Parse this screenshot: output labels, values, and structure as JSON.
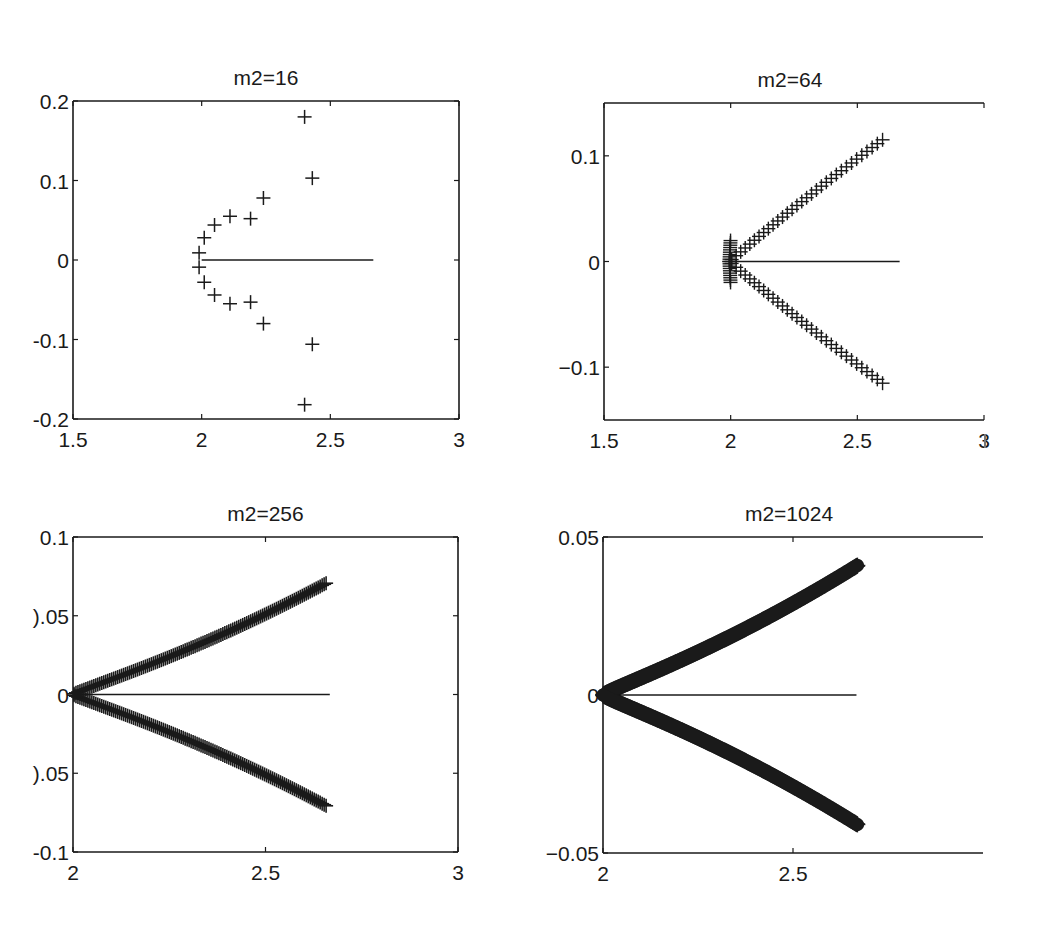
{
  "figure": {
    "background": "#ffffff",
    "ink_color": "#1a1a1a"
  },
  "chart_data": [
    {
      "type": "scatter",
      "title": "m2=16",
      "xlabel": "",
      "ylabel": "",
      "xlim": [
        1.5,
        3
      ],
      "ylim": [
        -0.2,
        0.2
      ],
      "xticks": [
        1.5,
        2,
        2.5,
        3
      ],
      "xtick_labels": [
        "1.5",
        "2",
        "2.5",
        "3"
      ],
      "yticks": [
        0.2,
        0.1,
        0,
        -0.1,
        -0.2
      ],
      "ytick_labels": [
        "0.2",
        "0.1",
        "0",
        "-0.1",
        "-0.2"
      ],
      "grid": false,
      "marker": "+",
      "box": {
        "left": 73,
        "top": 101,
        "right": 459,
        "bottom": 419,
        "clip_right": false
      },
      "series": [
        {
          "name": "eigenvalues",
          "marker": "+",
          "x": [
            1.99,
            2.01,
            2.05,
            2.11,
            2.19,
            2.24,
            2.43,
            2.4,
            1.99,
            2.01,
            2.05,
            2.11,
            2.19,
            2.24,
            2.43,
            2.4
          ],
          "y": [
            0.009,
            0.028,
            0.044,
            0.055,
            0.052,
            0.078,
            0.103,
            0.18,
            -0.009,
            -0.028,
            -0.044,
            -0.055,
            -0.053,
            -0.08,
            -0.106,
            -0.182
          ]
        },
        {
          "name": "continuous spectrum",
          "type": "line",
          "x": [
            2.0,
            2.667
          ],
          "y": [
            0,
            0
          ]
        }
      ]
    },
    {
      "type": "scatter",
      "title": "m2=64",
      "xlabel": "",
      "ylabel": "",
      "xlim": [
        1.5,
        3
      ],
      "ylim": [
        -0.15,
        0.15
      ],
      "xticks": [
        1.5,
        2,
        2.5,
        3
      ],
      "xtick_labels": [
        "1.5",
        "2",
        "2.5",
        "3"
      ],
      "yticks": [
        0.1,
        0,
        -0.1
      ],
      "ytick_labels": [
        "0.1",
        "0",
        "−0.1"
      ],
      "grid": false,
      "marker": "+",
      "box": {
        "left": 604,
        "top": 103,
        "right": 984,
        "bottom": 420,
        "clip_right": true
      },
      "branch": {
        "count": 32,
        "x_end": 2.61,
        "y_end": 0.117,
        "shape": "v",
        "tip_x": 1.995
      },
      "series": [
        {
          "name": "continuous spectrum",
          "type": "line",
          "x": [
            2.0,
            2.667
          ],
          "y": [
            0,
            0
          ]
        }
      ]
    },
    {
      "type": "scatter",
      "title": "m2=256",
      "xlabel": "",
      "ylabel": "",
      "xlim": [
        2,
        3
      ],
      "ylim": [
        -0.1,
        0.1
      ],
      "xticks": [
        2,
        2.5,
        3
      ],
      "xtick_labels": [
        "2",
        "2.5",
        "3"
      ],
      "yticks": [
        0.1,
        0.05,
        0,
        -0.05,
        -0.1
      ],
      "ytick_labels": [
        "0.1",
        ").05",
        "0",
        ").05",
        "-0.1"
      ],
      "grid": false,
      "marker": "+",
      "box": {
        "left": 73,
        "top": 537,
        "right": 458,
        "bottom": 852,
        "clip_right": false
      },
      "branch": {
        "count": 128,
        "x_end": 2.66,
        "y_end": 0.071,
        "shape": "convex",
        "tip_x": 2.0
      },
      "series": [
        {
          "name": "continuous spectrum",
          "type": "line",
          "x": [
            2.0,
            2.667
          ],
          "y": [
            0,
            0
          ]
        }
      ]
    },
    {
      "type": "scatter",
      "title": "m2=1024",
      "xlabel": "",
      "ylabel": "",
      "xlim": [
        2,
        3
      ],
      "ylim": [
        -0.05,
        0.05
      ],
      "xticks": [
        2,
        2.5
      ],
      "xtick_labels": [
        "2",
        "2.5"
      ],
      "yticks": [
        0.05,
        0,
        -0.05
      ],
      "ytick_labels": [
        "0.05",
        "0",
        "−0.05"
      ],
      "grid": false,
      "marker": "+",
      "box": {
        "left": 603,
        "top": 537,
        "right": 983,
        "bottom": 853,
        "clip_right": true
      },
      "branch": {
        "count": 512,
        "x_end": 2.67,
        "y_end": 0.041,
        "shape": "convex",
        "tip_x": 2.0
      },
      "series": [
        {
          "name": "continuous spectrum",
          "type": "line",
          "x": [
            2.0,
            2.667
          ],
          "y": [
            0,
            0
          ]
        }
      ]
    }
  ]
}
